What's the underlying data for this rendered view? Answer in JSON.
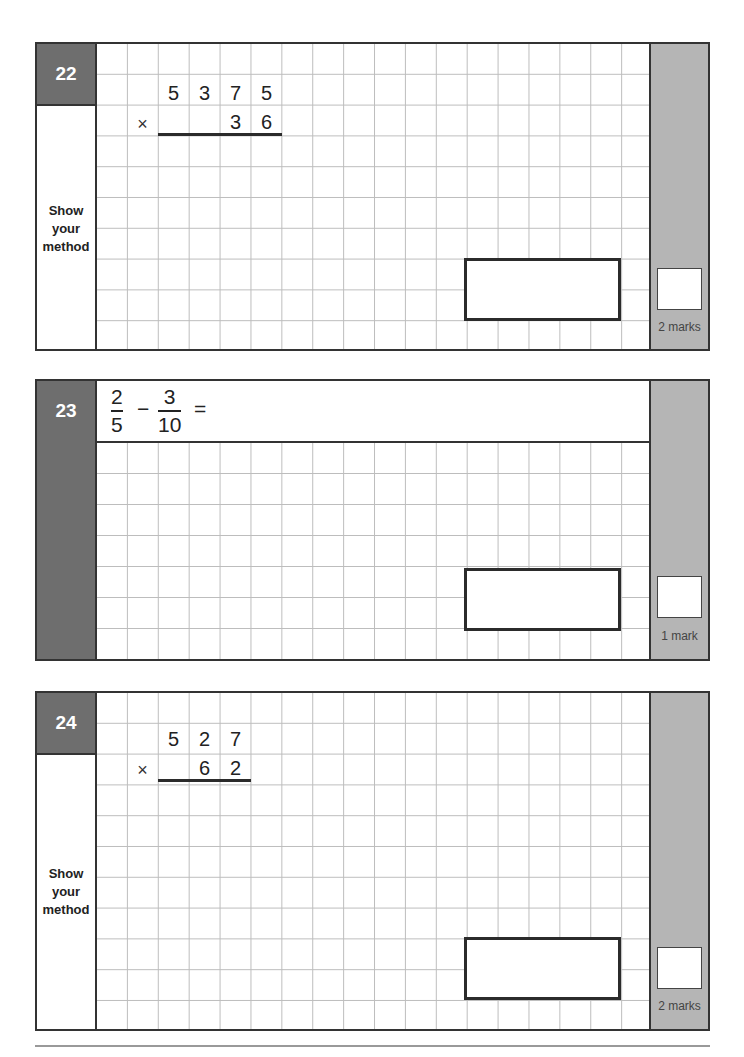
{
  "questions": [
    {
      "number": "22",
      "side_label_lines": [
        "Show",
        "your",
        "method"
      ],
      "calculation": {
        "type": "long-multiplication",
        "top_digits": [
          "5",
          "3",
          "7",
          "5"
        ],
        "operator": "×",
        "bottom_digits": [
          "3",
          "6"
        ]
      },
      "marks_label": "2 marks"
    },
    {
      "number": "23",
      "expression": {
        "fraction1": {
          "numerator": "2",
          "denominator": "5"
        },
        "operator": "−",
        "fraction2": {
          "numerator": "3",
          "denominator": "10"
        },
        "equals": "="
      },
      "marks_label": "1 mark"
    },
    {
      "number": "24",
      "side_label_lines": [
        "Show",
        "your",
        "method"
      ],
      "calculation": {
        "type": "long-multiplication",
        "top_digits": [
          "5",
          "2",
          "7"
        ],
        "operator": "×",
        "bottom_digits": [
          "6",
          "2"
        ]
      },
      "marks_label": "2 marks"
    }
  ],
  "colors": {
    "badge": "#6e6e6e",
    "mark_column": "#b5b5b5",
    "grid_line": "#bdbdbd",
    "border": "#333333"
  }
}
